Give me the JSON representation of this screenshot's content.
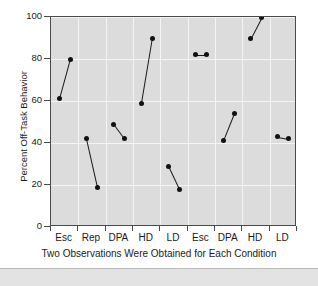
{
  "figure": {
    "background_color": "#ffffff",
    "plot_background_color": "#dcdcdc",
    "marker_color": "#111111",
    "grid_color": "#f4f4f4",
    "axis_color": "#4a4a4a"
  },
  "chart_data": {
    "type": "line",
    "title": "",
    "subtitle": "",
    "xlabel": "Two Observations Were Obtained for Each Condition",
    "ylabel": "Percent Off-Task Behavior",
    "categories": [
      "Esc",
      "Rep",
      "DPA",
      "HD",
      "LD",
      "Esc",
      "DPA",
      "HD",
      "LD"
    ],
    "ylim": [
      0,
      100
    ],
    "yticks": [
      0,
      20,
      40,
      60,
      80,
      100
    ],
    "ytick_labels": [
      "0",
      "20",
      "40",
      "60",
      "80",
      "100"
    ],
    "grid": true,
    "grid_axis": "both",
    "legend": "none",
    "series": [
      {
        "name": "Observation 1",
        "values": [
          61,
          42,
          49,
          59,
          29,
          82,
          41,
          90,
          43
        ]
      },
      {
        "name": "Observation 2",
        "values": [
          80,
          19,
          42,
          90,
          18,
          82,
          54,
          100,
          42
        ]
      }
    ],
    "pairs": [
      {
        "category": "Esc",
        "obs1": 61,
        "obs2": 80
      },
      {
        "category": "Rep",
        "obs1": 42,
        "obs2": 19
      },
      {
        "category": "DPA",
        "obs1": 49,
        "obs2": 42
      },
      {
        "category": "HD",
        "obs1": 59,
        "obs2": 90
      },
      {
        "category": "LD",
        "obs1": 29,
        "obs2": 18
      },
      {
        "category": "Esc",
        "obs1": 82,
        "obs2": 82
      },
      {
        "category": "DPA",
        "obs1": 41,
        "obs2": 54
      },
      {
        "category": "HD",
        "obs1": 90,
        "obs2": 100
      },
      {
        "category": "LD",
        "obs1": 43,
        "obs2": 42
      }
    ]
  }
}
